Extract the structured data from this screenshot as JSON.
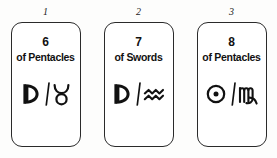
{
  "diagram": {
    "background_color": "#fdfdfc",
    "card_border_color": "#2a2a2a",
    "card_fill_color": "#ffffff",
    "text_color": "#111111",
    "cards": [
      {
        "position": "1",
        "rank": "6",
        "suit": "of Pentacles",
        "planet_symbol_name": "moon-symbol",
        "planet_symbol_glyph": "☽",
        "separator": "/",
        "zodiac_symbol_name": "taurus-symbol",
        "zodiac_symbol_glyph": "♉",
        "correspondence": "☽ / ♉"
      },
      {
        "position": "2",
        "rank": "7",
        "suit": "of Swords",
        "planet_symbol_name": "moon-symbol",
        "planet_symbol_glyph": "☽",
        "separator": "/",
        "zodiac_symbol_name": "aquarius-symbol",
        "zodiac_symbol_glyph": "♒",
        "correspondence": "☽ / ♒"
      },
      {
        "position": "3",
        "rank": "8",
        "suit": "of Pentacles",
        "planet_symbol_name": "sun-symbol",
        "planet_symbol_glyph": "☉",
        "separator": "/",
        "zodiac_symbol_name": "virgo-symbol",
        "zodiac_symbol_glyph": "♍",
        "correspondence": "☉ / ♍"
      }
    ]
  }
}
